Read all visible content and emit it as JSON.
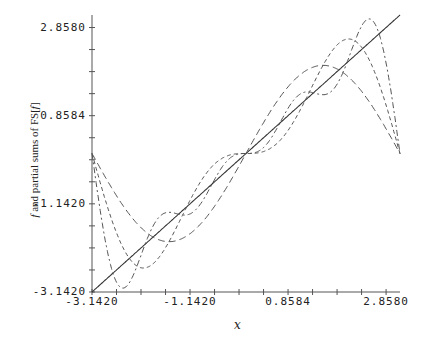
{
  "chart_data": {
    "type": "line",
    "title": "",
    "xlabel": "x",
    "ylabel_prefix": "f",
    "ylabel_mid": " and partial sums of FS[",
    "ylabel_f": "f",
    "ylabel_suffix": "]",
    "xlim": [
      -3.142,
      3.142
    ],
    "ylim": [
      -3.142,
      3.142
    ],
    "x_ticks": [
      "-3.1420",
      "-1.1420",
      "0.8584",
      "2.8580"
    ],
    "x_tick_values": [
      -3.142,
      -1.142,
      0.8584,
      2.858
    ],
    "y_ticks": [
      "-3.1420",
      "-1.1420",
      "0.8584",
      "2.8580"
    ],
    "y_tick_values": [
      -3.142,
      -1.142,
      0.8584,
      2.858
    ],
    "minor_tick_step": 0.5,
    "grid": false,
    "legend": null,
    "series": [
      {
        "name": "f(x) = x",
        "style": "solid",
        "fourier_terms": 0
      },
      {
        "name": "FS partial sum n=1",
        "style": "dashed",
        "fourier_terms": 1
      },
      {
        "name": "FS partial sum n=2",
        "style": "dashed",
        "fourier_terms": 2
      },
      {
        "name": "FS partial sum n=4",
        "style": "dashed",
        "fourier_terms": 4
      }
    ],
    "sample_points": {
      "x": [
        -3.142,
        -2.5,
        -1.57,
        -0.5,
        0,
        0.5,
        1.57,
        2.1,
        2.57,
        3.142
      ],
      "f": [
        -3.142,
        -2.5,
        -1.57,
        -0.5,
        0,
        0.5,
        1.57,
        2.1,
        2.57,
        3.142
      ],
      "n1": [
        0,
        -1.2,
        -2.0,
        -0.96,
        0,
        0.96,
        2.0,
        1.73,
        1.08,
        0
      ],
      "n2": [
        0,
        -2.15,
        -2.0,
        -0.12,
        0,
        0.12,
        2.0,
        2.6,
        1.99,
        0
      ],
      "n4": [
        0,
        -3.0,
        -1.33,
        -0.27,
        0,
        0.27,
        1.33,
        1.75,
        3.0,
        0
      ]
    }
  }
}
